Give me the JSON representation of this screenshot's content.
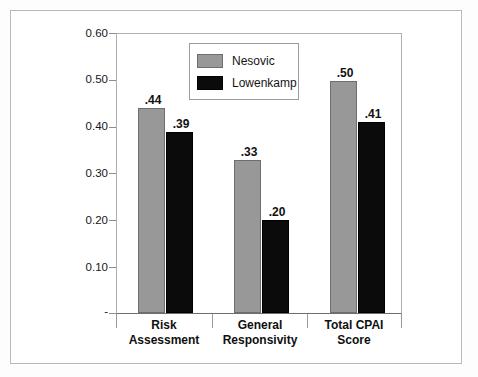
{
  "chart_data": {
    "type": "bar",
    "title": "",
    "subtitle": "",
    "xlabel": "",
    "ylabel": "",
    "ylim": [
      0,
      0.6
    ],
    "grid": false,
    "legend_position": "top-center-inside",
    "y_ticks": [
      "-",
      "0.10",
      "0.20",
      "0.30",
      "0.40",
      "0.50",
      "0.60"
    ],
    "y_tick_values": [
      0,
      0.1,
      0.2,
      0.3,
      0.4,
      0.5,
      0.6
    ],
    "categories": [
      "Risk Assessment",
      "General Responsivity",
      "Total CPAI Score"
    ],
    "category_lines": [
      [
        "Risk",
        "Assessment"
      ],
      [
        "General",
        "Responsivity"
      ],
      [
        "Total CPAI",
        "Score"
      ]
    ],
    "series": [
      {
        "name": "Nesovic",
        "color": "#989898",
        "values": [
          0.44,
          0.33,
          0.5
        ],
        "labels": [
          ".44",
          ".33",
          ".50"
        ]
      },
      {
        "name": "Lowenkamp",
        "color": "#0b0b0b",
        "values": [
          0.39,
          0.2,
          0.41
        ],
        "labels": [
          ".39",
          ".20",
          ".41"
        ]
      }
    ]
  },
  "legend": {
    "items": [
      {
        "label": "Nesovic"
      },
      {
        "label": "Lowenkamp"
      }
    ]
  },
  "colors": {
    "nesovic": "#989898",
    "lowenkamp": "#0b0b0b",
    "axis": "#8d8d8d",
    "frame": "#b9b9b9",
    "text": "#111111"
  }
}
